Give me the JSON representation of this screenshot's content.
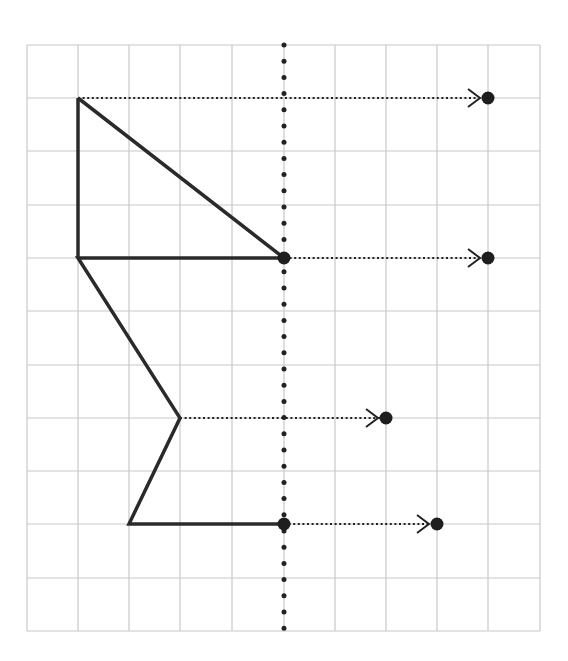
{
  "diagram": {
    "type": "grid-translation",
    "grid": {
      "columns": 10,
      "rows": 11,
      "x_lines": [
        27,
        78,
        129,
        180,
        232,
        284,
        335,
        386,
        437,
        488,
        540
      ],
      "y_lines": [
        45,
        98,
        151,
        205,
        258,
        311,
        365,
        418,
        471,
        524,
        578,
        631
      ],
      "line_color": "#c8c8c8"
    },
    "axis": {
      "x": 284,
      "y_top": 45,
      "y_bottom": 631,
      "style": "dotted",
      "color": "#222222"
    },
    "shape": {
      "color": "#2a2a2a",
      "points": [
        [
          78,
          98
        ],
        [
          284,
          258
        ],
        [
          78,
          258
        ],
        [
          180,
          418
        ],
        [
          129,
          524
        ],
        [
          284,
          524
        ]
      ],
      "closing_edges": [
        [
          [
            78,
            98
          ],
          [
            78,
            258
          ]
        ]
      ]
    },
    "arrows": [
      {
        "from": [
          78,
          98
        ],
        "to": [
          488,
          98
        ]
      },
      {
        "from": [
          78,
          258
        ],
        "to": [
          488,
          258
        ]
      },
      {
        "from": [
          180,
          418
        ],
        "to": [
          386,
          418
        ]
      },
      {
        "from": [
          284,
          524
        ],
        "to": [
          437,
          524
        ]
      }
    ],
    "axis_points": [
      [
        284,
        258
      ],
      [
        284,
        524
      ]
    ]
  }
}
